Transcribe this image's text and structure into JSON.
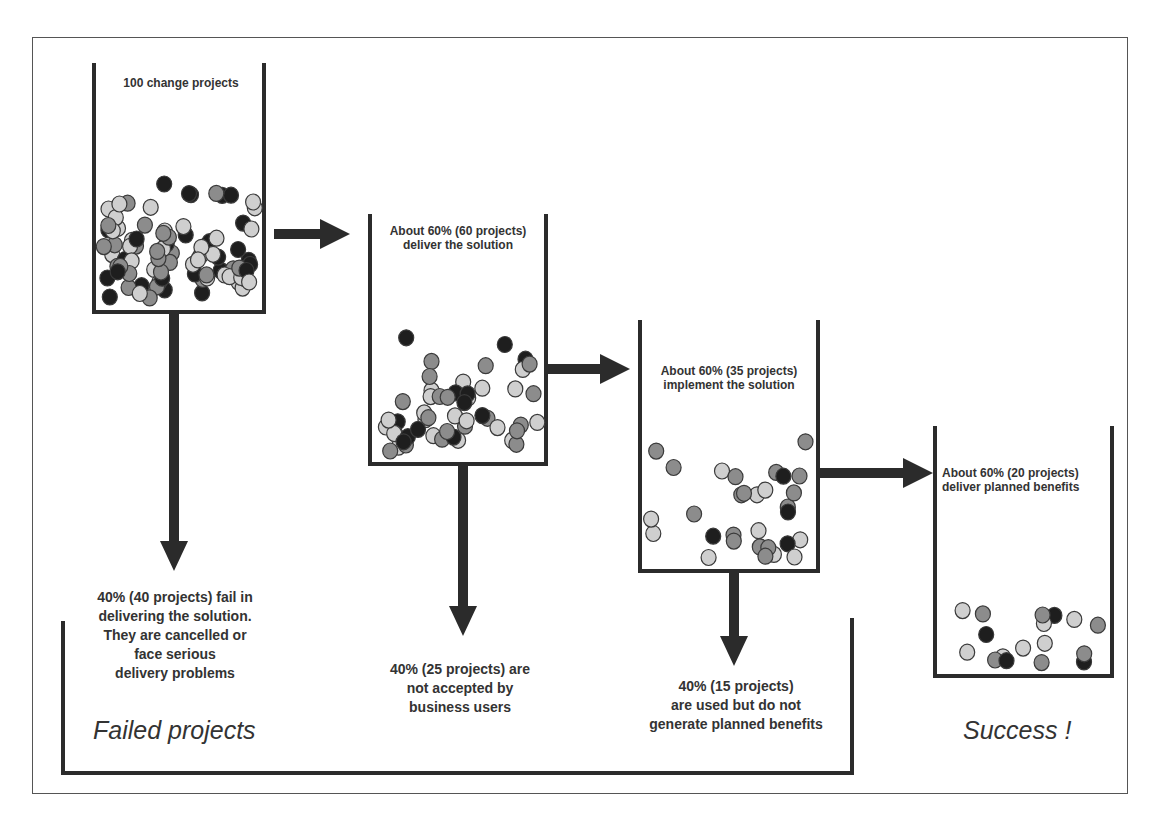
{
  "diagram": {
    "title": "",
    "colors": {
      "line": "#2b2b2b",
      "frame": "#555555",
      "ball_dark": "#1e1e1e",
      "ball_mid": "#8c8c8c",
      "ball_light": "#cfcfcf",
      "ball_stroke": "#3a3a3a"
    },
    "stages": [
      {
        "id": "stage-1",
        "label": "100 change projects",
        "count": 100
      },
      {
        "id": "stage-2",
        "label": "About 60% (60 projects)\ndeliver the solution",
        "count": 60
      },
      {
        "id": "stage-3",
        "label": "About 60% (35 projects)\nimplement the solution",
        "count": 35
      },
      {
        "id": "stage-4",
        "label": "About 60% (20 projects)\ndeliver planned benefits",
        "count": 20
      }
    ],
    "failures": [
      {
        "id": "fail-1",
        "label": "40% (40 projects) fail in\ndelivering the solution.\nThey are cancelled or\nface serious\ndelivery problems",
        "count": 40
      },
      {
        "id": "fail-2",
        "label": "40% (25 projects) are\nnot accepted by\nbusiness users",
        "count": 25
      },
      {
        "id": "fail-3",
        "label": "40% (15 projects)\nare used but do not\ngenerate planned benefits",
        "count": 15
      }
    ],
    "outcomes": {
      "failed": "Failed projects",
      "success": "Success !"
    }
  }
}
